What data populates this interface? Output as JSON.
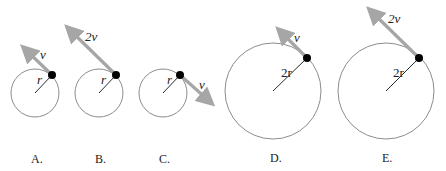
{
  "diagrams": [
    {
      "caption": "A.",
      "velocity_label": "v",
      "radius_label": "r"
    },
    {
      "caption": "B.",
      "velocity_label": "2v",
      "radius_label": "r"
    },
    {
      "caption": "C.",
      "velocity_label": "v",
      "radius_label": "r"
    },
    {
      "caption": "D.",
      "velocity_label": "v",
      "radius_label": "2r"
    },
    {
      "caption": "E.",
      "velocity_label": "2v",
      "radius_label": "2r"
    }
  ],
  "colors": {
    "circle": "#8c8c8c",
    "arrow": "#a6a6a6",
    "dot": "#000000",
    "radius": "#111111"
  }
}
